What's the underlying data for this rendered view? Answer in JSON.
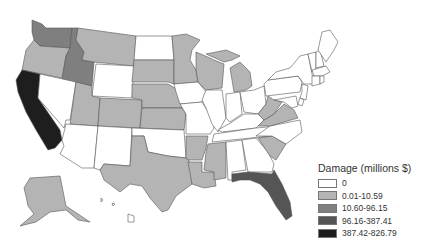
{
  "legend": {
    "title": "Damage (millions $)",
    "classes": [
      {
        "label": "0",
        "color": "#ffffff"
      },
      {
        "label": "0.01-10.59",
        "color": "#b4b4b4"
      },
      {
        "label": "10.60-96.15",
        "color": "#7f7f7f"
      },
      {
        "label": "96.16-387.41",
        "color": "#555555"
      },
      {
        "label": "387.42-826.79",
        "color": "#1e1e1e"
      }
    ]
  },
  "states": {
    "WA": 2,
    "OR": 1,
    "CA": 4,
    "ID": 2,
    "NV": 0,
    "MT": 1,
    "WY": 0,
    "UT": 1,
    "AZ": 0,
    "CO": 1,
    "NM": 0,
    "ND": 0,
    "SD": 1,
    "NE": 1,
    "KS": 1,
    "OK": 0,
    "TX": 1,
    "MN": 1,
    "IA": 0,
    "MO": 0,
    "AR": 1,
    "LA": 1,
    "WI": 1,
    "IL": 0,
    "MI": 1,
    "IN": 0,
    "OH": 0,
    "KY": 0,
    "TN": 0,
    "MS": 1,
    "AL": 0,
    "GA": 0,
    "FL": 3,
    "SC": 1,
    "NC": 0,
    "VA": 1,
    "WV": 1,
    "PA": 0,
    "NY": 0,
    "ME": 0,
    "NH": 0,
    "VT": 0,
    "MA": 0,
    "CT": 0,
    "RI": 0,
    "NJ": 0,
    "DE": 0,
    "MD": 0,
    "AK": 1,
    "HI": 0
  }
}
